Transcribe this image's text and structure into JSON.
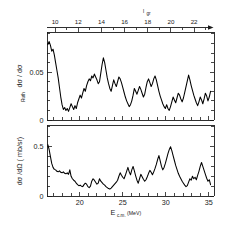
{
  "figure": {
    "background_color": "#ffffff",
    "curve_color": "#000000",
    "axis_color": "#1a1a1a"
  },
  "top_axis": {
    "name": "l_gr",
    "label_main": "l",
    "label_sub": "gr",
    "tick_labels": [
      "10",
      "12",
      "14",
      "16",
      "18",
      "20",
      "22"
    ],
    "tick_values": [
      10,
      12,
      14,
      16,
      18,
      20,
      22
    ],
    "minor_step": 1,
    "has_arrow_end": true
  },
  "panel_top": {
    "ylabel_main": "dσ / dσ",
    "ylabel_sub": "Ruth",
    "ytick_labels": [
      "0",
      "0.05"
    ],
    "ytick_values": [
      0,
      0.05
    ]
  },
  "panel_bottom": {
    "ylabel_main": "dσ /dΩ ( mb/sr)",
    "ytick_labels": [
      "0",
      "0.5"
    ],
    "ytick_values": [
      0,
      0.5
    ]
  },
  "x_axis": {
    "label_main": "E",
    "label_sub": "c.m.",
    "label_unit": "(MeV)",
    "tick_labels": [
      "20",
      "25",
      "30",
      "35"
    ],
    "tick_values": [
      20,
      25,
      30,
      35
    ],
    "minor_step": 1,
    "range": [
      16.2,
      35.6
    ]
  },
  "chart_data": {
    "type": "line",
    "title": "",
    "xlabel": "E_c.m. (MeV)",
    "subplots": [
      {
        "name": "ratio-to-rutherford",
        "ylabel": "dσ / dσ_Ruth",
        "xlim": [
          16.2,
          35.6
        ],
        "ylim": [
          0.0,
          0.092
        ],
        "grid": false,
        "x": [
          16.3,
          16.45,
          16.6,
          16.75,
          16.9,
          17.05,
          17.2,
          17.35,
          17.5,
          17.65,
          17.8,
          17.95,
          18.1,
          18.25,
          18.4,
          18.55,
          18.7,
          18.85,
          19.0,
          19.15,
          19.3,
          19.45,
          19.6,
          19.75,
          19.9,
          20.05,
          20.2,
          20.35,
          20.5,
          20.65,
          20.8,
          20.95,
          21.1,
          21.25,
          21.4,
          21.55,
          21.7,
          21.85,
          22.0,
          22.15,
          22.3,
          22.45,
          22.6,
          22.75,
          22.9,
          23.05,
          23.2,
          23.35,
          23.5,
          23.65,
          23.8,
          23.95,
          24.1,
          24.25,
          24.4,
          24.55,
          24.7,
          24.85,
          25.0,
          25.15,
          25.3,
          25.45,
          25.6,
          25.75,
          25.9,
          26.05,
          26.2,
          26.35,
          26.5,
          26.65,
          26.8,
          26.95,
          27.1,
          27.25,
          27.4,
          27.55,
          27.7,
          27.85,
          28.0,
          28.15,
          28.3,
          28.45,
          28.6,
          28.75,
          28.9,
          29.05,
          29.2,
          29.35,
          29.5,
          29.65,
          29.8,
          29.95,
          30.1,
          30.25,
          30.4,
          30.55,
          30.7,
          30.85,
          31.0,
          31.15,
          31.3,
          31.45,
          31.6,
          31.75,
          31.9,
          32.05,
          32.2,
          32.35,
          32.5,
          32.65,
          32.8,
          32.95,
          33.1,
          33.25,
          33.4,
          33.55,
          33.7,
          33.85,
          34.0,
          34.15,
          34.3,
          34.45,
          34.6,
          34.75,
          34.9,
          35.05,
          35.2
        ],
        "y": [
          0.079,
          0.082,
          0.078,
          0.072,
          0.074,
          0.068,
          0.06,
          0.052,
          0.044,
          0.034,
          0.024,
          0.016,
          0.011,
          0.013,
          0.01,
          0.012,
          0.009,
          0.013,
          0.017,
          0.014,
          0.011,
          0.015,
          0.012,
          0.018,
          0.022,
          0.026,
          0.023,
          0.028,
          0.033,
          0.03,
          0.036,
          0.04,
          0.043,
          0.041,
          0.046,
          0.044,
          0.048,
          0.045,
          0.042,
          0.038,
          0.04,
          0.049,
          0.058,
          0.065,
          0.06,
          0.052,
          0.044,
          0.038,
          0.033,
          0.03,
          0.036,
          0.042,
          0.038,
          0.035,
          0.04,
          0.045,
          0.043,
          0.039,
          0.034,
          0.029,
          0.024,
          0.02,
          0.017,
          0.014,
          0.016,
          0.02,
          0.026,
          0.033,
          0.03,
          0.027,
          0.031,
          0.035,
          0.032,
          0.028,
          0.024,
          0.027,
          0.034,
          0.04,
          0.043,
          0.039,
          0.035,
          0.038,
          0.043,
          0.046,
          0.042,
          0.036,
          0.03,
          0.025,
          0.021,
          0.017,
          0.014,
          0.012,
          0.016,
          0.012,
          0.01,
          0.014,
          0.019,
          0.024,
          0.021,
          0.018,
          0.023,
          0.028,
          0.026,
          0.022,
          0.019,
          0.023,
          0.029,
          0.035,
          0.041,
          0.047,
          0.042,
          0.036,
          0.031,
          0.026,
          0.022,
          0.018,
          0.015,
          0.019,
          0.024,
          0.021,
          0.017,
          0.022,
          0.028,
          0.025,
          0.02,
          0.024,
          0.03
        ]
      },
      {
        "name": "differential-cross-section",
        "ylabel": "dσ /dΩ ( mb/sr)",
        "xlim": [
          16.2,
          35.6
        ],
        "ylim": [
          0.0,
          0.72
        ],
        "grid": false,
        "x": [
          16.3,
          16.45,
          16.6,
          16.75,
          16.9,
          17.05,
          17.2,
          17.35,
          17.5,
          17.65,
          17.8,
          17.95,
          18.1,
          18.25,
          18.4,
          18.55,
          18.7,
          18.85,
          19.0,
          19.15,
          19.3,
          19.45,
          19.6,
          19.75,
          19.9,
          20.05,
          20.2,
          20.35,
          20.5,
          20.65,
          20.8,
          20.95,
          21.1,
          21.25,
          21.4,
          21.55,
          21.7,
          21.85,
          22.0,
          22.15,
          22.3,
          22.45,
          22.6,
          22.75,
          22.9,
          23.05,
          23.2,
          23.35,
          23.5,
          23.65,
          23.8,
          23.95,
          24.1,
          24.25,
          24.4,
          24.55,
          24.7,
          24.85,
          25.0,
          25.15,
          25.3,
          25.45,
          25.6,
          25.75,
          25.9,
          26.05,
          26.2,
          26.35,
          26.5,
          26.65,
          26.8,
          26.95,
          27.1,
          27.25,
          27.4,
          27.55,
          27.7,
          27.85,
          28.0,
          28.15,
          28.3,
          28.45,
          28.6,
          28.75,
          28.9,
          29.05,
          29.2,
          29.35,
          29.5,
          29.65,
          29.8,
          29.95,
          30.1,
          30.25,
          30.4,
          30.55,
          30.7,
          30.85,
          31.0,
          31.15,
          31.3,
          31.45,
          31.6,
          31.75,
          31.9,
          32.05,
          32.2,
          32.35,
          32.5,
          32.65,
          32.8,
          32.95,
          33.1,
          33.25,
          33.4,
          33.55,
          33.7,
          33.85,
          34.0,
          34.15,
          34.3,
          34.45,
          34.6,
          34.75,
          34.9,
          35.05,
          35.2
        ],
        "y": [
          0.52,
          0.47,
          0.4,
          0.33,
          0.29,
          0.27,
          0.265,
          0.25,
          0.245,
          0.255,
          0.24,
          0.235,
          0.245,
          0.23,
          0.225,
          0.235,
          0.22,
          0.265,
          0.2,
          0.175,
          0.16,
          0.15,
          0.13,
          0.115,
          0.105,
          0.11,
          0.1,
          0.095,
          0.115,
          0.13,
          0.12,
          0.095,
          0.085,
          0.1,
          0.15,
          0.175,
          0.16,
          0.14,
          0.12,
          0.13,
          0.175,
          0.15,
          0.135,
          0.12,
          0.11,
          0.095,
          0.085,
          0.075,
          0.07,
          0.08,
          0.095,
          0.11,
          0.125,
          0.14,
          0.16,
          0.2,
          0.235,
          0.21,
          0.19,
          0.175,
          0.21,
          0.25,
          0.29,
          0.245,
          0.215,
          0.265,
          0.3,
          0.255,
          0.205,
          0.16,
          0.13,
          0.175,
          0.22,
          0.195,
          0.17,
          0.15,
          0.165,
          0.195,
          0.23,
          0.26,
          0.24,
          0.215,
          0.245,
          0.28,
          0.32,
          0.37,
          0.41,
          0.355,
          0.3,
          0.265,
          0.29,
          0.33,
          0.38,
          0.43,
          0.47,
          0.5,
          0.46,
          0.41,
          0.36,
          0.31,
          0.27,
          0.23,
          0.2,
          0.175,
          0.15,
          0.13,
          0.11,
          0.095,
          0.105,
          0.14,
          0.175,
          0.16,
          0.2,
          0.175,
          0.19,
          0.165,
          0.21,
          0.25,
          0.3,
          0.34,
          0.3,
          0.26,
          0.22,
          0.18,
          0.15,
          0.165,
          0.115
        ]
      }
    ]
  }
}
